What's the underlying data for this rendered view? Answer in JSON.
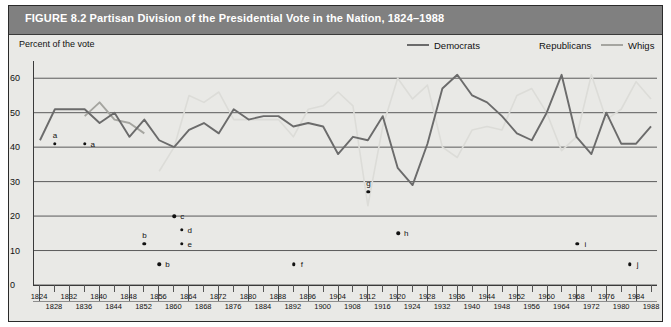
{
  "figure": {
    "title": "FIGURE 8.2  Partisan Division of the Presidential Vote in the Nation, 1824–1988",
    "axis_title": "Percent of the vote",
    "header_color": "#808080",
    "panel_color": "#e9e9e6"
  },
  "legend": {
    "position": "top-right",
    "entries": [
      {
        "label": "Democrats",
        "color": "#6b6b6b",
        "x": 398,
        "swatch": true
      },
      {
        "label": "Republicans",
        "color": "#dcdcd8",
        "x": 503,
        "swatch": false
      },
      {
        "label": "Whigs",
        "color": "#a5a5a0",
        "x": 592,
        "swatch": true
      }
    ]
  },
  "chart_data": {
    "type": "line",
    "title": "Partisan Division of the Presidential Vote in the Nation, 1824–1988",
    "xlabel": "",
    "ylabel": "Percent of the vote",
    "xlim": [
      1824,
      1988
    ],
    "ylim": [
      0,
      65
    ],
    "yticks": [
      0,
      10,
      20,
      30,
      40,
      50,
      60
    ],
    "xticks": [
      1824,
      1828,
      1832,
      1836,
      1840,
      1844,
      1848,
      1852,
      1856,
      1860,
      1864,
      1868,
      1872,
      1876,
      1880,
      1884,
      1888,
      1892,
      1896,
      1900,
      1904,
      1908,
      1912,
      1916,
      1920,
      1924,
      1928,
      1932,
      1936,
      1940,
      1944,
      1948,
      1952,
      1956,
      1960,
      1964,
      1968,
      1972,
      1976,
      1980,
      1984,
      1988
    ],
    "grid": "horizontal",
    "legend_position": "top-right",
    "series": [
      {
        "name": "Democrats",
        "color": "#6b6b6b",
        "x": [
          1824,
          1828,
          1832,
          1836,
          1840,
          1844,
          1848,
          1852,
          1856,
          1860,
          1864,
          1868,
          1872,
          1876,
          1880,
          1884,
          1888,
          1892,
          1896,
          1900,
          1904,
          1908,
          1912,
          1916,
          1920,
          1924,
          1928,
          1932,
          1936,
          1940,
          1944,
          1948,
          1952,
          1956,
          1960,
          1964,
          1968,
          1972,
          1976,
          1980,
          1984,
          1988
        ],
        "values": [
          42,
          51,
          51,
          51,
          47,
          50,
          43,
          48,
          42,
          40,
          45,
          47,
          44,
          51,
          48,
          49,
          49,
          46,
          47,
          46,
          38,
          43,
          42,
          49,
          34,
          29,
          41,
          57,
          61,
          55,
          53,
          49,
          44,
          42,
          50,
          61,
          43,
          38,
          50,
          41,
          41,
          46
        ]
      },
      {
        "name": "Republicans",
        "color": "#dcdcd8",
        "x": [
          1856,
          1860,
          1864,
          1868,
          1872,
          1876,
          1880,
          1884,
          1888,
          1892,
          1896,
          1900,
          1904,
          1908,
          1912,
          1916,
          1920,
          1924,
          1928,
          1932,
          1936,
          1940,
          1944,
          1948,
          1952,
          1956,
          1960,
          1964,
          1968,
          1972,
          1976,
          1980,
          1984,
          1988
        ],
        "values": [
          33,
          40,
          55,
          53,
          56,
          48,
          48,
          48,
          48,
          43,
          51,
          52,
          56,
          52,
          23,
          46,
          60,
          54,
          58,
          40,
          37,
          45,
          46,
          45,
          55,
          57,
          50,
          39,
          43,
          61,
          48,
          51,
          59,
          54
        ]
      },
      {
        "name": "Whigs",
        "color": "#a5a5a0",
        "x": [
          1836,
          1840,
          1844,
          1848,
          1852
        ],
        "values": [
          49,
          53,
          48,
          47,
          44
        ]
      }
    ],
    "annotations": [
      {
        "label": "a",
        "x": 1828,
        "y": 41,
        "label_pos": "above"
      },
      {
        "label": "a",
        "x": 1836,
        "y": 41,
        "label_pos": "right"
      },
      {
        "label": "b",
        "x": 1852,
        "y": 12,
        "label_pos": "above"
      },
      {
        "label": "b",
        "x": 1856,
        "y": 6,
        "label_pos": "right"
      },
      {
        "label": "c",
        "x": 1860,
        "y": 20,
        "label_pos": "right"
      },
      {
        "label": "d",
        "x": 1862,
        "y": 16,
        "label_pos": "right"
      },
      {
        "label": "e",
        "x": 1862,
        "y": 12,
        "label_pos": "right"
      },
      {
        "label": "f",
        "x": 1892,
        "y": 6,
        "label_pos": "right"
      },
      {
        "label": "g",
        "x": 1912,
        "y": 27,
        "label_pos": "above"
      },
      {
        "label": "h",
        "x": 1920,
        "y": 15,
        "label_pos": "right"
      },
      {
        "label": "i",
        "x": 1968,
        "y": 12,
        "label_pos": "right"
      },
      {
        "label": "j",
        "x": 1982,
        "y": 6,
        "label_pos": "right"
      }
    ]
  }
}
